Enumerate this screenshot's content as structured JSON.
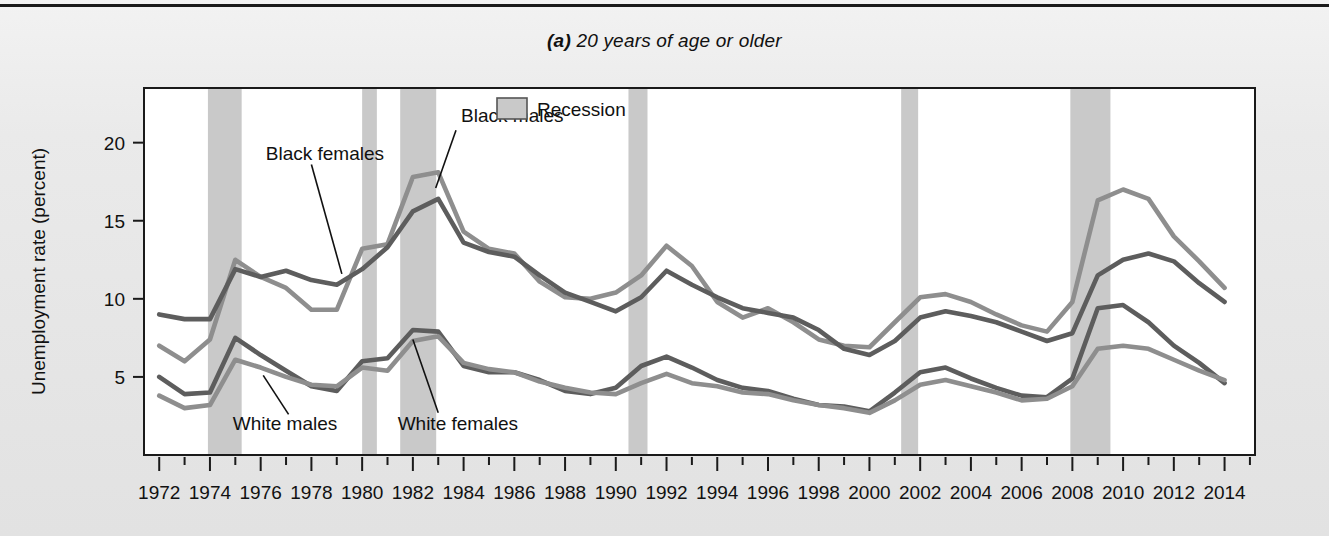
{
  "figure": {
    "panel_letter": "(a)",
    "title_rest": " 20 years of age or older",
    "title_full": "(a) 20 years of age or older"
  },
  "axes": {
    "ylabel": "Unemployment rate (percent)",
    "yticks": [
      "5",
      "10",
      "15",
      "20"
    ],
    "ytick_values": [
      5,
      10,
      15,
      20
    ],
    "ylim": [
      0,
      23.5
    ],
    "xlim": [
      1971.4,
      2015.2
    ],
    "xticks": [
      "1972",
      "1974",
      "1976",
      "1978",
      "1980",
      "1982",
      "1984",
      "1986",
      "1988",
      "1990",
      "1992",
      "1994",
      "1996",
      "1998",
      "2000",
      "2002",
      "2004",
      "2006",
      "2008",
      "2010",
      "2012",
      "2014"
    ],
    "xtick_values": [
      1972,
      1974,
      1976,
      1978,
      1980,
      1982,
      1984,
      1986,
      1988,
      1990,
      1992,
      1994,
      1996,
      1998,
      2000,
      2002,
      2004,
      2006,
      2008,
      2010,
      2012,
      2014
    ],
    "minor_tick_step": 1
  },
  "legend": {
    "position": "top-center-inside",
    "items": [
      {
        "label": "Recession",
        "swatch_color": "#c9c9c9",
        "swatch_border": "#555555"
      }
    ]
  },
  "annotations": [
    {
      "id": "black-females",
      "text": "Black females",
      "text_x": 1976.2,
      "text_y": 19.3,
      "leader_from_x": 1978.0,
      "leader_from_y": 18.6,
      "leader_to_x": 1979.2,
      "leader_to_y": 11.6
    },
    {
      "id": "black-males",
      "text": "Black males",
      "text_x": 1983.9,
      "text_y": 21.7,
      "leader_from_x": 1983.7,
      "leader_from_y": 20.8,
      "leader_to_x": 1982.9,
      "leader_to_y": 17.1
    },
    {
      "id": "white-males",
      "text": "White males",
      "text_x": 1974.9,
      "text_y": 2.0,
      "leader_from_x": 1977.1,
      "leader_from_y": 2.6,
      "leader_to_x": 1976.1,
      "leader_to_y": 5.1
    },
    {
      "id": "white-females",
      "text": "White females",
      "text_x": 1981.4,
      "text_y": 2.0,
      "leader_from_x": 1983.0,
      "leader_from_y": 2.7,
      "leader_to_x": 1982.0,
      "leader_to_y": 7.4
    }
  ],
  "chart_data": {
    "type": "line",
    "title": "(a) 20 years of age or older",
    "xlabel": "",
    "ylabel": "Unemployment rate (percent)",
    "xlim": [
      1971.4,
      2015.2
    ],
    "ylim": [
      0,
      23.5
    ],
    "grid": false,
    "x": [
      1972,
      1973,
      1974,
      1975,
      1976,
      1977,
      1978,
      1979,
      1980,
      1981,
      1982,
      1983,
      1984,
      1985,
      1986,
      1987,
      1988,
      1989,
      1990,
      1991,
      1992,
      1993,
      1994,
      1995,
      1996,
      1997,
      1998,
      1999,
      2000,
      2001,
      2002,
      2003,
      2004,
      2005,
      2006,
      2007,
      2008,
      2009,
      2010,
      2011,
      2012,
      2013,
      2014
    ],
    "series": [
      {
        "name": "Black males",
        "color": "#8e8e8e",
        "values": [
          7.0,
          6.0,
          7.4,
          12.5,
          11.4,
          10.7,
          9.3,
          9.3,
          13.2,
          13.5,
          17.8,
          18.1,
          14.3,
          13.2,
          12.9,
          11.1,
          10.1,
          10.0,
          10.4,
          11.5,
          13.4,
          12.1,
          9.8,
          8.8,
          9.4,
          8.5,
          7.4,
          7.0,
          6.9,
          8.5,
          10.1,
          10.3,
          9.8,
          9.0,
          8.3,
          7.9,
          9.8,
          16.3,
          17.0,
          16.4,
          14.0,
          12.4,
          10.7
        ]
      },
      {
        "name": "Black females",
        "color": "#5d5d5d",
        "values": [
          9.0,
          8.7,
          8.7,
          11.9,
          11.4,
          11.8,
          11.2,
          10.9,
          11.9,
          13.3,
          15.6,
          16.4,
          13.6,
          13.0,
          12.7,
          11.5,
          10.4,
          9.8,
          9.2,
          10.1,
          11.8,
          10.9,
          10.1,
          9.4,
          9.1,
          8.8,
          8.0,
          6.8,
          6.4,
          7.3,
          8.8,
          9.2,
          8.9,
          8.5,
          7.9,
          7.3,
          7.8,
          11.5,
          12.5,
          12.9,
          12.4,
          11.0,
          9.8
        ]
      },
      {
        "name": "White males",
        "color": "#5d5d5d",
        "values": [
          5.0,
          3.9,
          4.0,
          7.5,
          6.4,
          5.4,
          4.4,
          4.1,
          6.0,
          6.2,
          8.0,
          7.9,
          5.7,
          5.3,
          5.3,
          4.8,
          4.1,
          3.9,
          4.3,
          5.7,
          6.3,
          5.6,
          4.8,
          4.3,
          4.1,
          3.6,
          3.2,
          3.1,
          2.8,
          4.0,
          5.3,
          5.6,
          4.9,
          4.3,
          3.8,
          3.7,
          4.9,
          9.4,
          9.6,
          8.5,
          7.0,
          5.9,
          4.6
        ]
      },
      {
        "name": "White females",
        "color": "#8e8e8e",
        "values": [
          3.8,
          3.0,
          3.2,
          6.1,
          5.6,
          5.0,
          4.5,
          4.4,
          5.6,
          5.4,
          7.3,
          7.6,
          5.9,
          5.5,
          5.3,
          4.7,
          4.3,
          4.0,
          3.9,
          4.6,
          5.2,
          4.6,
          4.4,
          4.0,
          3.9,
          3.5,
          3.2,
          3.0,
          2.7,
          3.5,
          4.5,
          4.8,
          4.4,
          4.0,
          3.5,
          3.6,
          4.4,
          6.8,
          7.0,
          6.8,
          6.1,
          5.4,
          4.8
        ]
      }
    ],
    "recessions": [
      {
        "start": 1973.92,
        "end": 1975.25
      },
      {
        "start": 1980.0,
        "end": 1980.58
      },
      {
        "start": 1981.5,
        "end": 1982.92
      },
      {
        "start": 1990.5,
        "end": 1991.25
      },
      {
        "start": 2001.25,
        "end": 2001.92
      },
      {
        "start": 2007.92,
        "end": 2009.5
      }
    ]
  }
}
